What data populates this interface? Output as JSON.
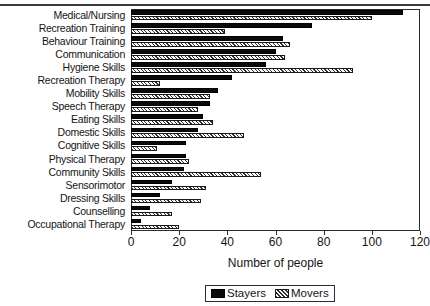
{
  "chart_data": {
    "type": "bar",
    "orientation": "horizontal",
    "title": "",
    "xlabel": "Number of people",
    "ylabel": "",
    "xlim": [
      0,
      120
    ],
    "xticks": [
      0,
      20,
      40,
      60,
      80,
      100,
      120
    ],
    "grid": false,
    "legend_position": "bottom-center",
    "categories": [
      "Medical/Nursing",
      "Recreation Training",
      "Behaviour Training",
      "Communication",
      "Hygiene Skills",
      "Recreation Therapy",
      "Mobility Skills",
      "Speech Therapy",
      "Eating Skills",
      "Domestic Skills",
      "Cognitive Skills",
      "Physical Therapy",
      "Community Skills",
      "Sensorimotor",
      "Dressing Skills",
      "Counselling",
      "Occupational Therapy"
    ],
    "series": [
      {
        "name": "Stayers",
        "color": "#0a0a0a",
        "pattern": "solid",
        "values": [
          113,
          75,
          63,
          60,
          56,
          42,
          36,
          33,
          30,
          28,
          23,
          23,
          22,
          17,
          12,
          8,
          4
        ]
      },
      {
        "name": "Movers",
        "color": "#ffffff",
        "pattern": "diagonal-hatch",
        "values": [
          100,
          39,
          66,
          64,
          92,
          12,
          33,
          28,
          34,
          47,
          11,
          24,
          54,
          31,
          29,
          17,
          20
        ]
      }
    ]
  },
  "legend": {
    "items": [
      {
        "label": "Stayers"
      },
      {
        "label": "Movers"
      }
    ]
  }
}
